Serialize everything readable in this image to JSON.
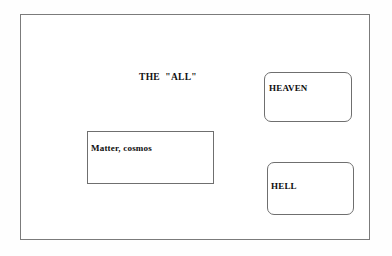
{
  "diagram": {
    "title": "THE  \"ALL\"",
    "frame": {
      "border_color": "#7b7b7b",
      "background_color": "#ffffff"
    },
    "regions": [
      {
        "id": "matter",
        "label": "Matter, cosmos",
        "shape": "rectangle",
        "corner": "square",
        "border_color": "#6f6f6f"
      },
      {
        "id": "heaven",
        "label": "HEAVEN",
        "shape": "rounded-rectangle",
        "corner": "rounded",
        "border_color": "#6f6f6f"
      },
      {
        "id": "hell",
        "label": "HELL",
        "shape": "rounded-rectangle",
        "corner": "rounded",
        "border_color": "#6f6f6f"
      }
    ]
  }
}
